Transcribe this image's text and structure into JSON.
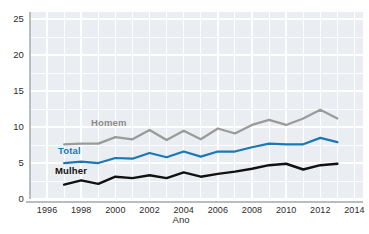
{
  "chart_data": {
    "type": "line",
    "title": "",
    "xlabel": "Ano",
    "ylabel": "",
    "x": [
      1997,
      1998,
      1999,
      2000,
      2001,
      2002,
      2003,
      2004,
      2005,
      2006,
      2007,
      2008,
      2009,
      2010,
      2011,
      2012,
      2013
    ],
    "xlim": [
      1995,
      2014.5
    ],
    "ylim": [
      0,
      26
    ],
    "xticks": [
      1996,
      1998,
      2000,
      2002,
      2004,
      2006,
      2008,
      2010,
      2012,
      2014
    ],
    "yticks": [
      0,
      5,
      10,
      15,
      20,
      25
    ],
    "grid": true,
    "legend": "inline-labels",
    "series": [
      {
        "name": "Homem",
        "color": "#9a9a9a",
        "values": [
          7.6,
          7.7,
          7.7,
          8.6,
          8.3,
          9.6,
          8.2,
          9.5,
          8.3,
          9.8,
          9.1,
          10.3,
          11.0,
          10.3,
          11.2,
          12.4,
          11.2
        ]
      },
      {
        "name": "Total",
        "color": "#1a78b4",
        "values": [
          5.0,
          5.2,
          5.0,
          5.7,
          5.6,
          6.4,
          5.8,
          6.6,
          5.9,
          6.6,
          6.6,
          7.2,
          7.7,
          7.6,
          7.6,
          8.5,
          7.9
        ]
      },
      {
        "name": "Mulher",
        "color": "#111111",
        "values": [
          2.0,
          2.6,
          2.1,
          3.1,
          2.9,
          3.3,
          2.9,
          3.7,
          3.1,
          3.5,
          3.8,
          4.2,
          4.7,
          4.9,
          4.1,
          4.7,
          4.9
        ]
      }
    ],
    "series_labels": [
      {
        "name": "Homem",
        "x_px": 91,
        "y_px": 117
      },
      {
        "name": "Total",
        "x_px": 58,
        "y_px": 145
      },
      {
        "name": "Mulher",
        "x_px": 55,
        "y_px": 165
      }
    ]
  },
  "axes": {
    "y_tick_labels": [
      "25",
      "20",
      "15",
      "10",
      "5",
      "0"
    ],
    "x_tick_labels": [
      "1996",
      "1998",
      "2000",
      "2002",
      "2004",
      "2006",
      "2008",
      "2010",
      "2012",
      "2014"
    ],
    "x_axis_title": "Ano"
  },
  "colors": {
    "plot_background": "#eaeef2",
    "grid": "#ffffff",
    "axis_line": "#b8bdc2",
    "homem": "#9a9a9a",
    "total": "#1a78b4",
    "mulher": "#111111",
    "text": "#2b2b2b"
  }
}
